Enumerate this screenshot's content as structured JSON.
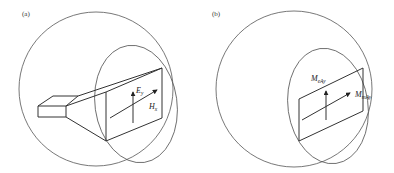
{
  "figure": {
    "panels": [
      {
        "id": "a",
        "label": "(a)",
        "description": "Pyramidal horn antenna inside sphere with aperture surface",
        "field_labels": {
          "e_field": {
            "main": "E",
            "sub": "y"
          },
          "h_field": {
            "main": "H",
            "sub": "x"
          }
        }
      },
      {
        "id": "b",
        "label": "(b)",
        "description": "Equivalent aperture with magnetic and electric current sources",
        "field_labels": {
          "electric_current": {
            "main": "M",
            "sub": "eAy"
          },
          "magnetic_current": {
            "main": "M",
            "sub": "mAy"
          }
        }
      }
    ],
    "colors": {
      "line": "#333333",
      "hatch": "#bbbbbb",
      "background": "#ffffff"
    }
  }
}
